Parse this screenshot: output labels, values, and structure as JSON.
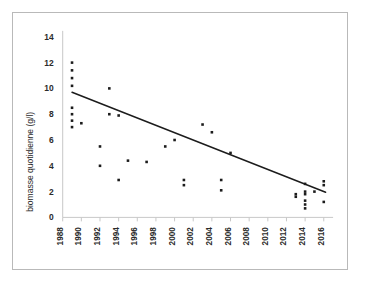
{
  "chart_data": {
    "type": "scatter",
    "title": "",
    "subtitle": "",
    "xlabel": "",
    "ylabel": "biomasse quotidienne (g/l)",
    "xlim": [
      1988,
      2017
    ],
    "ylim": [
      0,
      14
    ],
    "grid": false,
    "legend": "none",
    "x_ticks": [
      1988,
      1990,
      1992,
      1994,
      1996,
      1998,
      2000,
      2002,
      2004,
      2006,
      2008,
      2010,
      2012,
      2014,
      2016
    ],
    "y_ticks": [
      0,
      2,
      4,
      6,
      8,
      10,
      12,
      14
    ],
    "series": [
      {
        "name": "biomasse quotidienne",
        "marker": "square",
        "color": "#1c1c1c",
        "points": [
          [
            1989,
            12.0
          ],
          [
            1989,
            11.4
          ],
          [
            1989,
            10.8
          ],
          [
            1989,
            10.2
          ],
          [
            1989,
            8.5
          ],
          [
            1989,
            8.0
          ],
          [
            1989,
            7.5
          ],
          [
            1989,
            7.0
          ],
          [
            1990,
            7.3
          ],
          [
            1992,
            5.5
          ],
          [
            1992,
            4.0
          ],
          [
            1993,
            10.0
          ],
          [
            1993,
            8.0
          ],
          [
            1994,
            7.9
          ],
          [
            1994,
            2.9
          ],
          [
            1995,
            4.4
          ],
          [
            1997,
            4.3
          ],
          [
            1999,
            5.5
          ],
          [
            2000,
            6.0
          ],
          [
            2001,
            2.9
          ],
          [
            2001,
            2.5
          ],
          [
            2003,
            7.2
          ],
          [
            2004,
            6.6
          ],
          [
            2005,
            2.9
          ],
          [
            2005,
            2.1
          ],
          [
            2006,
            5.0
          ],
          [
            2013,
            1.8
          ],
          [
            2013,
            1.6
          ],
          [
            2014,
            2.6
          ],
          [
            2014,
            2.0
          ],
          [
            2014,
            1.8
          ],
          [
            2014,
            1.3
          ],
          [
            2014,
            1.0
          ],
          [
            2014,
            0.7
          ],
          [
            2015,
            2.0
          ],
          [
            2016,
            2.8
          ],
          [
            2016,
            2.5
          ],
          [
            2016,
            1.2
          ]
        ]
      }
    ],
    "trendline": {
      "name": "linear trend",
      "color": "#1c1c1c",
      "x_start": 1989,
      "y_start": 9.7,
      "x_end": 2016.2,
      "y_end": 1.95
    }
  }
}
